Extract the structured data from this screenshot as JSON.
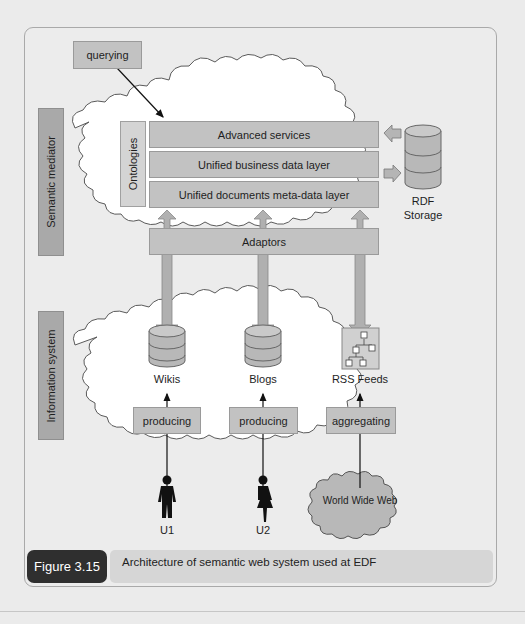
{
  "figure": {
    "number_label": "Figure 3.15",
    "caption": "Architecture of semantic web system used at EDF"
  },
  "layers": {
    "semantic_mediator_label": "Semantic mediator",
    "information_system_label": "Information system"
  },
  "mediator": {
    "querying": "querying",
    "ontologies": "Ontologies",
    "stack": [
      "Advanced services",
      "Unified business data layer",
      "Unified documents meta-data layer"
    ],
    "rdf_storage": [
      "RDF",
      "Storage"
    ],
    "adaptors": "Adaptors"
  },
  "sources": [
    {
      "name": "Wikis",
      "action": "producing",
      "actor": "U1",
      "icon": "database-icon"
    },
    {
      "name": "Blogs",
      "action": "producing",
      "actor": "U2",
      "icon": "database-icon"
    },
    {
      "name": "RSS Feeds",
      "action": "aggregating",
      "actor": "World Wide Web",
      "icon": "tree-hierarchy-icon"
    }
  ],
  "colors": {
    "box_fill": "#c2c2c2",
    "label_fill": "#a9a9a9",
    "caption_tag": "#2f2f2f",
    "caption_bg": "#d6d6d6",
    "cloud_fill": "#ffffff",
    "page_bg": "#ebebeb"
  }
}
